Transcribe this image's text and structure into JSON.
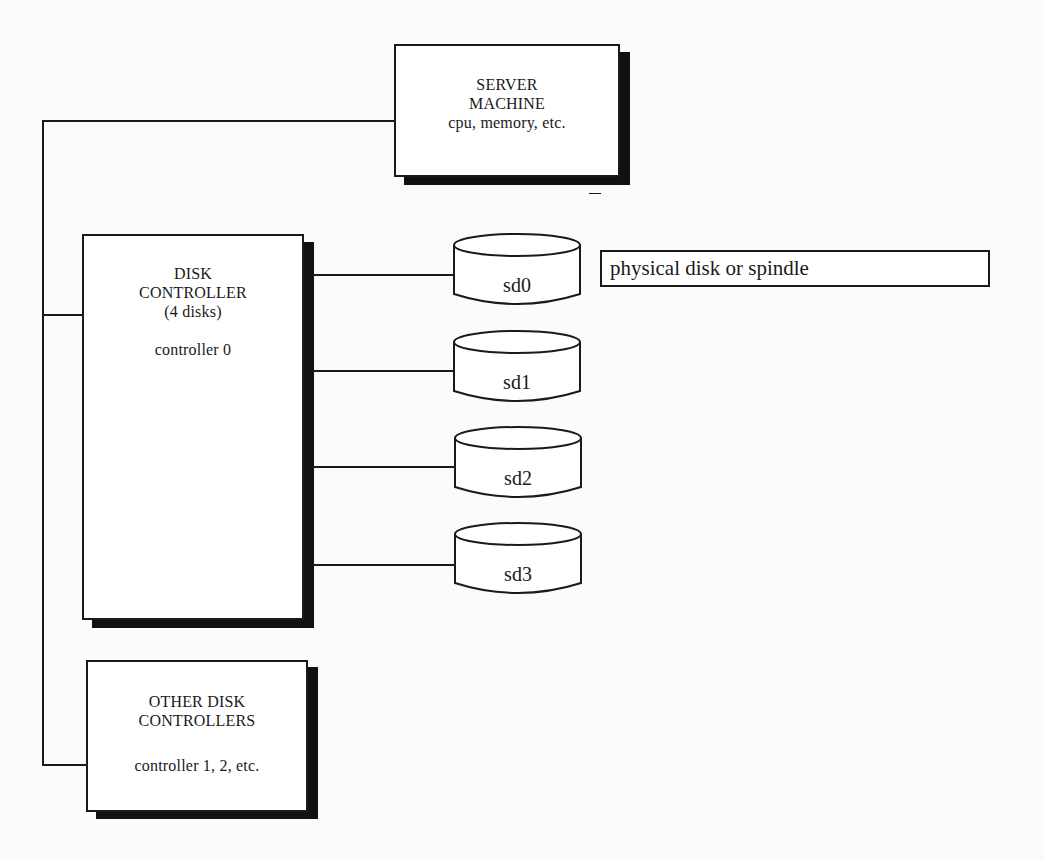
{
  "diagram": {
    "server": {
      "line1": "SERVER",
      "line2": "MACHINE",
      "line3": "cpu, memory, etc."
    },
    "controller0": {
      "line1": "DISK",
      "line2": "CONTROLLER",
      "line3": "(4 disks)",
      "line4": "controller 0"
    },
    "other_controllers": {
      "line1": "OTHER DISK",
      "line2": "CONTROLLERS",
      "line3": "controller 1, 2, etc."
    },
    "disks": [
      {
        "label": "sd0"
      },
      {
        "label": "sd1"
      },
      {
        "label": "sd2"
      },
      {
        "label": "sd3"
      }
    ],
    "callout": {
      "text": "physical disk or spindle"
    }
  }
}
